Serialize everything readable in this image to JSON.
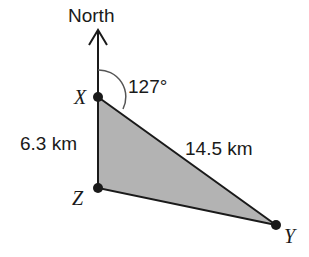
{
  "diagram": {
    "north_label": "North",
    "angle_label": "127°",
    "points": {
      "X": "X",
      "Y": "Y",
      "Z": "Z"
    },
    "side_xz": "6.3 km",
    "side_xy": "14.5 km",
    "colors": {
      "fill": "#b3b3b3",
      "stroke": "#1a1a1a",
      "arc": "#555555"
    }
  }
}
